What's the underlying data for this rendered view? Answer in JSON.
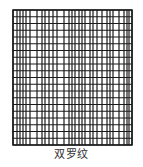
{
  "figure": {
    "caption": "双罗纹",
    "pattern_name": "double-rib-knit-pattern",
    "colors": {
      "line": "#1a1a1a",
      "background": "#ffffff",
      "caption": "#333333"
    },
    "grid": {
      "left": 13,
      "top": 10,
      "right": 132,
      "bottom": 145,
      "vertical_lines": [
        13,
        17,
        20,
        23,
        26,
        30,
        37,
        42,
        45,
        49,
        53,
        57,
        64,
        69,
        72,
        75,
        79,
        82,
        85,
        90,
        93,
        97,
        102,
        107,
        110,
        113,
        119,
        124,
        127,
        129,
        132
      ],
      "horizontal_lines": [
        10,
        16.75,
        23.5,
        30.25,
        37,
        43.75,
        50.5,
        57.25,
        64,
        70.75,
        77.5,
        84.25,
        91,
        97.75,
        104.5,
        111.25,
        118,
        124.75,
        131.5,
        138.25,
        145
      ],
      "line_width": 1.2
    }
  }
}
